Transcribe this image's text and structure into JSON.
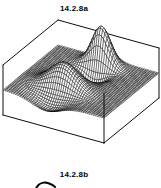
{
  "page": {
    "background": "#ffffff"
  },
  "figure_a": {
    "label": "14.2.8a"
  },
  "figure_b": {
    "label": "14.2.8b"
  },
  "chart_data": {
    "type": "surface",
    "title": "14.2.8a",
    "grid": {
      "divisions": 48,
      "u_range": [
        0,
        1
      ],
      "v_range": [
        0,
        1
      ]
    },
    "z_plane": 0,
    "features": [
      {
        "name": "rear-spike",
        "center_u": 0.5,
        "center_v": 0.78,
        "amplitude": 1.55,
        "sharpness": 0.016
      },
      {
        "name": "front-spike",
        "center_u": 0.42,
        "center_v": 0.2,
        "amplitude": 0.95,
        "sharpness": 0.038
      }
    ],
    "negative_scale": 0.45,
    "z_clip": [
      -0.46,
      0.82
    ],
    "colors": {
      "line": "#000000",
      "surface_fill": "#ffffff",
      "box_edge": "#000000",
      "background": "#ffffff"
    }
  }
}
